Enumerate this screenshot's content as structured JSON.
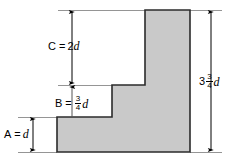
{
  "figure": {
    "type": "engineering-dimension-diagram",
    "fill_color": "#c9c9c9",
    "outline_color": "#2b2b2b",
    "line_color": "#000000",
    "background_color": "#ffffff"
  },
  "shape": {
    "name": "stepped-profile",
    "points": "57,117 112,117 112,85 145,85 145,10 190,10 190,152 57,152"
  },
  "dimensions": [
    {
      "id": "C",
      "name": "dimension-c",
      "label_prefix": "C",
      "operator": "=",
      "coefficient": "2",
      "variable": "d",
      "has_fraction": false,
      "text": "C = 2d"
    },
    {
      "id": "B",
      "name": "dimension-b",
      "label_prefix": "B",
      "operator": "=",
      "coefficient": "",
      "fraction_numerator": "3",
      "fraction_denominator": "4",
      "variable": "d",
      "has_fraction": true,
      "text": "B = 3/4 d"
    },
    {
      "id": "A",
      "name": "dimension-a",
      "label_prefix": "A",
      "operator": "=",
      "coefficient": "",
      "variable": "d",
      "has_fraction": false,
      "text": "A = d"
    },
    {
      "id": "H",
      "name": "dimension-total-height",
      "label_prefix": "",
      "operator": "",
      "coefficient": "3",
      "fraction_numerator": "3",
      "fraction_denominator": "4",
      "variable": "d",
      "has_fraction": true,
      "text": "3 3/4 d"
    }
  ]
}
